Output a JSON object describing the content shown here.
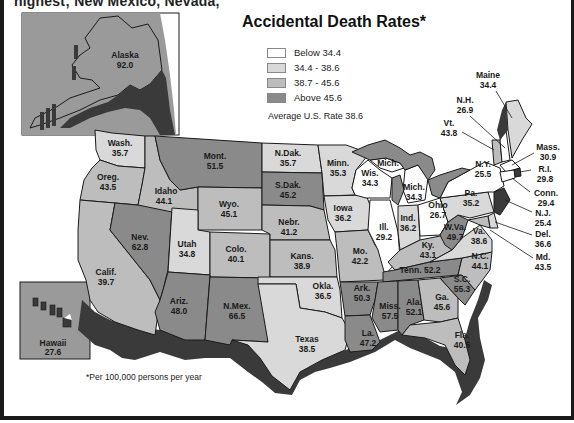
{
  "header": {
    "cut_text": "highest; New Mexico, Nevada,",
    "title": "Accidental Death Rates*"
  },
  "legend": {
    "items": [
      {
        "label": "Below 34.4",
        "color": "#ffffff"
      },
      {
        "label": "34.4 - 38.6",
        "color": "#d9d9d9"
      },
      {
        "label": "38.7 - 45.6",
        "color": "#bdbdbd"
      },
      {
        "label": "Above 45.6",
        "color": "#8a8a8a"
      }
    ],
    "average": "Average U.S. Rate 38.6"
  },
  "footnote": "*Per 100,000 persons per year",
  "colors": {
    "shadow": "#3a3a3a",
    "frame": "#1a1a1a",
    "inset_bg": "#9a9a9a"
  },
  "states": {
    "alaska": {
      "name": "Alaska",
      "rate": "92.0"
    },
    "hawaii": {
      "name": "Hawaii",
      "rate": "27.6"
    },
    "wash": {
      "name": "Wash.",
      "rate": "35.7"
    },
    "oreg": {
      "name": "Oreg.",
      "rate": "43.5"
    },
    "calif": {
      "name": "Calif.",
      "rate": "39.7"
    },
    "idaho": {
      "name": "Idaho",
      "rate": "44.1"
    },
    "nev": {
      "name": "Nev.",
      "rate": "62.8"
    },
    "mont": {
      "name": "Mont.",
      "rate": "51.5"
    },
    "wyo": {
      "name": "Wyo.",
      "rate": "45.1"
    },
    "utah": {
      "name": "Utah",
      "rate": "34.8"
    },
    "colo": {
      "name": "Colo.",
      "rate": "40.1"
    },
    "ariz": {
      "name": "Ariz.",
      "rate": "48.0"
    },
    "nmex": {
      "name": "N.Mex.",
      "rate": "66.5"
    },
    "ndak": {
      "name": "N.Dak.",
      "rate": "35.7"
    },
    "sdak": {
      "name": "S.Dak.",
      "rate": "45.2"
    },
    "nebr": {
      "name": "Nebr.",
      "rate": "41.2"
    },
    "kans": {
      "name": "Kans.",
      "rate": "38.9"
    },
    "okla": {
      "name": "Okla.",
      "rate": "36.5"
    },
    "texas": {
      "name": "Texas",
      "rate": "38.5"
    },
    "minn": {
      "name": "Minn.",
      "rate": "35.3"
    },
    "iowa": {
      "name": "Iowa",
      "rate": "36.2"
    },
    "mo": {
      "name": "Mo.",
      "rate": "42.2"
    },
    "ark": {
      "name": "Ark.",
      "rate": "50.3"
    },
    "la": {
      "name": "La.",
      "rate": "47.2"
    },
    "wis": {
      "name": "Wis.",
      "rate": "34.3"
    },
    "ill": {
      "name": "Ill.",
      "rate": "29.2"
    },
    "mich_up": {
      "name": "Mich."
    },
    "mich": {
      "name": "Mich.",
      "rate": "34.3"
    },
    "ind": {
      "name": "Ind.",
      "rate": "36.2"
    },
    "ohio": {
      "name": "Ohio",
      "rate": "26.7"
    },
    "ky": {
      "name": "Ky.",
      "rate": "43.1"
    },
    "tenn": {
      "name": "Tenn.",
      "rate": "52.2"
    },
    "miss": {
      "name": "Miss.",
      "rate": "57.5"
    },
    "ala": {
      "name": "Ala.",
      "rate": "52.1"
    },
    "ga": {
      "name": "Ga.",
      "rate": "45.6"
    },
    "fla": {
      "name": "Fla.",
      "rate": "40.5"
    },
    "sc": {
      "name": "S.C.",
      "rate": "55.3"
    },
    "nc": {
      "name": "N.C.",
      "rate": "44.1"
    },
    "va": {
      "name": "Va.",
      "rate": "38.6"
    },
    "wva": {
      "name": "W.Va.",
      "rate": "49.7"
    },
    "pa": {
      "name": "Pa.",
      "rate": "35.2"
    },
    "ny": {
      "name": "N.Y.",
      "rate": "25.5"
    },
    "vt": {
      "name": "Vt.",
      "rate": "43.8"
    },
    "nh": {
      "name": "N.H.",
      "rate": "26.9"
    },
    "maine": {
      "name": "Maine",
      "rate": "34.4"
    },
    "mass": {
      "name": "Mass.",
      "rate": "30.9"
    },
    "ri": {
      "name": "R.I.",
      "rate": "29.8"
    },
    "conn": {
      "name": "Conn.",
      "rate": "29.4"
    },
    "nj": {
      "name": "N.J.",
      "rate": "25.4"
    },
    "del": {
      "name": "Del.",
      "rate": "36.6"
    },
    "md": {
      "name": "Md.",
      "rate": "43.5"
    }
  }
}
